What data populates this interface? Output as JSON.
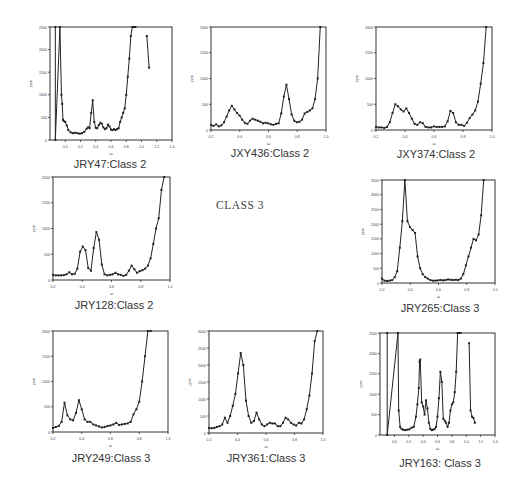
{
  "page": {
    "center_label": "CLASS 3"
  },
  "chart_data": [
    {
      "id": "JRY47",
      "type": "line",
      "title": "JRY47:Class 2",
      "xlabel": "ω",
      "ylabel": "ppm",
      "xticks": [
        "0.0",
        "0.2",
        "0.4",
        "0.6",
        "0.8",
        "1.0",
        "1.2",
        "1.4"
      ],
      "xlim": [
        -0.2,
        1.4
      ],
      "yticks": [
        "0",
        "500",
        "1000",
        "1500",
        "2000",
        "2500"
      ],
      "ylim": [
        0,
        2500
      ],
      "grid": false,
      "frame": {
        "x": 50,
        "y": 27,
        "w": 122,
        "h": 113
      },
      "caption_pos": {
        "x": 110,
        "y": 158
      },
      "x": [
        -0.13,
        -0.13,
        -0.07,
        -0.05,
        -0.04,
        -0.03,
        -0.02,
        0.0,
        0.02,
        0.04,
        0.07,
        0.1,
        0.13,
        0.16,
        0.19,
        0.22,
        0.25,
        0.28,
        0.3,
        0.32,
        0.34,
        0.36,
        0.38,
        0.4,
        0.42,
        0.44,
        0.46,
        0.48,
        0.5,
        0.52,
        0.54,
        0.56,
        0.58,
        0.6,
        0.62,
        0.64,
        0.66,
        0.68,
        0.7,
        0.72,
        0.74,
        0.76,
        0.78,
        0.8,
        0.82,
        0.84,
        0.86,
        0.88,
        0.9,
        0.92
      ],
      "values": [
        2500,
        0,
        2500,
        1000,
        800,
        450,
        420,
        400,
        320,
        220,
        170,
        150,
        160,
        150,
        140,
        150,
        180,
        250,
        280,
        260,
        600,
        880,
        400,
        270,
        260,
        330,
        380,
        360,
        280,
        240,
        260,
        340,
        300,
        230,
        220,
        240,
        220,
        240,
        260,
        400,
        500,
        600,
        700,
        1000,
        1400,
        1800,
        2300,
        2500,
        2500,
        2500
      ],
      "extra_segment": {
        "x": [
          1.07,
          1.1
        ],
        "values": [
          2300,
          1600
        ]
      }
    },
    {
      "id": "JXY436",
      "type": "line",
      "title": "JXY436:Class 2",
      "xlabel": "ω",
      "ylabel": "ppm",
      "xticks": [
        "0.2",
        "0.4",
        "0.6",
        "0.8",
        "1.0"
      ],
      "xlim": [
        0.2,
        1.0
      ],
      "yticks": [
        "0",
        "500",
        "1000",
        "1500",
        "2000"
      ],
      "ylim": [
        0,
        2000
      ],
      "grid": false,
      "frame": {
        "x": 211,
        "y": 27,
        "w": 115,
        "h": 103
      },
      "caption_pos": {
        "x": 270,
        "y": 147
      },
      "x": [
        0.2,
        0.22,
        0.24,
        0.26,
        0.28,
        0.3,
        0.32,
        0.34,
        0.36,
        0.38,
        0.4,
        0.42,
        0.44,
        0.46,
        0.48,
        0.5,
        0.52,
        0.54,
        0.56,
        0.58,
        0.6,
        0.62,
        0.64,
        0.66,
        0.68,
        0.7,
        0.72,
        0.74,
        0.76,
        0.78,
        0.8,
        0.82,
        0.84,
        0.86,
        0.88,
        0.9,
        0.92,
        0.94,
        0.96
      ],
      "values": [
        100,
        80,
        110,
        70,
        90,
        150,
        260,
        380,
        470,
        400,
        330,
        280,
        200,
        140,
        120,
        180,
        220,
        200,
        180,
        160,
        130,
        140,
        130,
        110,
        100,
        120,
        130,
        320,
        650,
        880,
        600,
        300,
        180,
        150,
        160,
        200,
        320,
        350,
        380,
        420,
        600,
        1000,
        2000
      ],
      "xs_note": "approximate digitization"
    },
    {
      "id": "JXY374",
      "type": "line",
      "title": "JXY374:Class 2",
      "xlabel": "ω",
      "ylabel": "ppm",
      "xticks": [
        "0.2",
        "0.4",
        "0.6",
        "0.8",
        "1.0"
      ],
      "xlim": [
        0.2,
        1.0
      ],
      "yticks": [
        "0",
        "500",
        "1000",
        "1500",
        "2000"
      ],
      "ylim": [
        0,
        2000
      ],
      "grid": false,
      "frame": {
        "x": 376,
        "y": 27,
        "w": 116,
        "h": 103
      },
      "caption_pos": {
        "x": 436,
        "y": 148
      },
      "x": [
        0.2,
        0.22,
        0.24,
        0.26,
        0.28,
        0.3,
        0.32,
        0.34,
        0.36,
        0.38,
        0.4,
        0.42,
        0.44,
        0.46,
        0.48,
        0.5,
        0.52,
        0.54,
        0.56,
        0.58,
        0.6,
        0.62,
        0.64,
        0.66,
        0.68,
        0.7,
        0.72,
        0.74,
        0.76,
        0.78,
        0.8,
        0.82,
        0.84,
        0.86,
        0.88,
        0.9,
        0.92,
        0.94,
        0.96
      ],
      "values": [
        60,
        50,
        50,
        40,
        60,
        150,
        330,
        500,
        460,
        400,
        360,
        420,
        330,
        220,
        120,
        100,
        150,
        130,
        60,
        50,
        50,
        70,
        60,
        60,
        60,
        70,
        170,
        370,
        330,
        150,
        100,
        100,
        80,
        140,
        230,
        300,
        380,
        550,
        900,
        1300,
        2000
      ]
    },
    {
      "id": "JRY128",
      "type": "line",
      "title": "JRY128:Class 2",
      "xlabel": "ω",
      "ylabel": "ppm",
      "xticks": [
        "0.2",
        "0.4",
        "0.6",
        "0.8",
        "1.0"
      ],
      "xlim": [
        0.2,
        1.0
      ],
      "yticks": [
        "0",
        "500",
        "1000",
        "1500",
        "2000"
      ],
      "ylim": [
        0,
        2000
      ],
      "grid": false,
      "frame": {
        "x": 53,
        "y": 177,
        "w": 117,
        "h": 103
      },
      "caption_pos": {
        "x": 114,
        "y": 299
      },
      "x": [
        0.2,
        0.22,
        0.24,
        0.26,
        0.28,
        0.3,
        0.32,
        0.34,
        0.36,
        0.38,
        0.4,
        0.42,
        0.44,
        0.46,
        0.48,
        0.5,
        0.52,
        0.54,
        0.56,
        0.58,
        0.6,
        0.62,
        0.64,
        0.66,
        0.68,
        0.7,
        0.72,
        0.74,
        0.76,
        0.78,
        0.8,
        0.82,
        0.84,
        0.86,
        0.88,
        0.9,
        0.92,
        0.94,
        0.96
      ],
      "values": [
        100,
        90,
        90,
        90,
        95,
        110,
        150,
        110,
        120,
        220,
        550,
        650,
        580,
        230,
        180,
        620,
        930,
        780,
        300,
        110,
        90,
        100,
        110,
        140,
        110,
        100,
        80,
        100,
        180,
        280,
        210,
        140,
        170,
        190,
        220,
        280,
        420,
        700,
        1000,
        1200,
        1750,
        2000
      ]
    },
    {
      "id": "JRY265",
      "type": "line",
      "title": "JRY265:Class 3",
      "xlabel": "ω",
      "ylabel": "ppm",
      "xticks": [
        "0.2",
        "0.4",
        "0.6",
        "0.8",
        "1.0"
      ],
      "xlim": [
        0.2,
        1.0
      ],
      "yticks": [
        "0",
        "500",
        "1000",
        "1500",
        "2000",
        "2500",
        "3000",
        "3500"
      ],
      "ylim": [
        0,
        3500
      ],
      "grid": false,
      "frame": {
        "x": 382,
        "y": 180,
        "w": 113,
        "h": 103
      },
      "caption_pos": {
        "x": 440,
        "y": 302
      },
      "x": [
        0.2,
        0.22,
        0.24,
        0.26,
        0.28,
        0.3,
        0.32,
        0.34,
        0.36,
        0.37,
        0.38,
        0.39,
        0.4,
        0.42,
        0.44,
        0.46,
        0.48,
        0.5,
        0.52,
        0.54,
        0.56,
        0.58,
        0.6,
        0.62,
        0.64,
        0.66,
        0.68,
        0.7,
        0.72,
        0.74,
        0.76,
        0.78,
        0.8,
        0.82,
        0.84,
        0.86,
        0.88,
        0.9,
        0.92
      ],
      "values": [
        150,
        80,
        70,
        80,
        100,
        200,
        400,
        1200,
        2100,
        3500,
        2100,
        1900,
        1800,
        1700,
        900,
        500,
        300,
        200,
        150,
        100,
        80,
        80,
        90,
        100,
        90,
        100,
        120,
        110,
        100,
        110,
        100,
        150,
        300,
        600,
        900,
        1200,
        1500,
        1450,
        1650,
        2300,
        3500
      ]
    },
    {
      "id": "JRY249",
      "type": "line",
      "title": "JRY249:Class 3",
      "xlabel": "ω",
      "ylabel": "ppm",
      "xticks": [
        "0.2",
        "0.4",
        "0.6",
        "0.8",
        "1.0"
      ],
      "xlim": [
        0.2,
        1.0
      ],
      "yticks": [
        "0",
        "500",
        "1000",
        "1500",
        "2000"
      ],
      "ylim": [
        0,
        2000
      ],
      "grid": false,
      "frame": {
        "x": 53,
        "y": 331,
        "w": 115,
        "h": 101
      },
      "caption_pos": {
        "x": 111,
        "y": 452
      },
      "x": [
        0.2,
        0.22,
        0.24,
        0.26,
        0.28,
        0.3,
        0.32,
        0.34,
        0.36,
        0.38,
        0.4,
        0.42,
        0.44,
        0.46,
        0.48,
        0.5,
        0.52,
        0.54,
        0.56,
        0.58,
        0.6,
        0.62,
        0.64,
        0.66,
        0.68,
        0.7,
        0.72,
        0.74,
        0.76,
        0.78,
        0.8,
        0.82,
        0.84,
        0.86,
        0.88
      ],
      "values": [
        80,
        100,
        120,
        200,
        580,
        330,
        250,
        230,
        380,
        630,
        450,
        250,
        200,
        200,
        150,
        130,
        110,
        90,
        100,
        120,
        130,
        150,
        180,
        140,
        150,
        160,
        170,
        200,
        350,
        450,
        600,
        1000,
        1500,
        2000,
        2000
      ]
    },
    {
      "id": "JRY361",
      "type": "line",
      "title": "JRY361:Class 3",
      "xlabel": "ω",
      "ylabel": "ppm",
      "xticks": [
        "0.2",
        "0.4",
        "0.6",
        "0.8",
        "1.0"
      ],
      "xlim": [
        0.2,
        1.0
      ],
      "yticks": [
        "0",
        "500",
        "1000",
        "1500",
        "2000",
        "2500",
        "3000"
      ],
      "ylim": [
        0,
        3000
      ],
      "grid": false,
      "frame": {
        "x": 209,
        "y": 331,
        "w": 114,
        "h": 102
      },
      "caption_pos": {
        "x": 266,
        "y": 452
      },
      "x": [
        0.2,
        0.22,
        0.24,
        0.26,
        0.28,
        0.3,
        0.32,
        0.34,
        0.36,
        0.38,
        0.4,
        0.42,
        0.44,
        0.46,
        0.48,
        0.5,
        0.52,
        0.54,
        0.56,
        0.58,
        0.6,
        0.62,
        0.64,
        0.66,
        0.68,
        0.7,
        0.72,
        0.74,
        0.76,
        0.78,
        0.8,
        0.82,
        0.84,
        0.86,
        0.88,
        0.9,
        0.92,
        0.94,
        0.96
      ],
      "values": [
        150,
        140,
        150,
        180,
        200,
        250,
        450,
        300,
        500,
        800,
        1150,
        1750,
        2350,
        2000,
        950,
        500,
        300,
        350,
        600,
        400,
        250,
        200,
        250,
        300,
        280,
        280,
        200,
        200,
        300,
        450,
        400,
        300,
        250,
        220,
        300,
        280,
        400,
        700,
        1100,
        1750,
        2700,
        3000
      ]
    },
    {
      "id": "JRY163",
      "type": "line",
      "title": "JRY163: Class 3",
      "xlabel": "ω",
      "ylabel": "ppm",
      "xticks": [
        "0.0",
        "0.2",
        "0.4",
        "0.6",
        "0.8",
        "1.0",
        "1.2",
        "1.4"
      ],
      "xlim": [
        -0.2,
        1.4
      ],
      "yticks": [
        "0",
        "500",
        "1000",
        "1500",
        "2000",
        "2500"
      ],
      "ylim": [
        0,
        2500
      ],
      "grid": false,
      "frame": {
        "x": 380,
        "y": 333,
        "w": 115,
        "h": 102
      },
      "caption_pos": {
        "x": 440,
        "y": 457
      },
      "x": [
        -0.1,
        -0.1,
        0.05,
        0.06,
        0.08,
        0.1,
        0.12,
        0.15,
        0.18,
        0.21,
        0.24,
        0.27,
        0.3,
        0.32,
        0.34,
        0.35,
        0.36,
        0.38,
        0.4,
        0.42,
        0.44,
        0.46,
        0.48,
        0.5,
        0.52,
        0.54,
        0.56,
        0.58,
        0.6,
        0.62,
        0.64,
        0.66,
        0.68,
        0.7,
        0.72,
        0.74,
        0.76,
        0.78,
        0.8,
        0.82,
        0.84,
        0.86,
        0.88,
        0.9,
        0.92
      ],
      "values": [
        2500,
        0,
        2500,
        600,
        200,
        150,
        130,
        120,
        130,
        140,
        180,
        200,
        450,
        750,
        1150,
        1800,
        1850,
        800,
        700,
        500,
        850,
        650,
        300,
        150,
        120,
        130,
        150,
        200,
        450,
        900,
        1550,
        1300,
        400,
        350,
        300,
        200,
        300,
        600,
        750,
        800,
        1050,
        1550,
        2500,
        2500,
        2500
      ],
      "extra_segment": {
        "x": [
          1.04,
          1.06,
          1.08,
          1.1,
          1.12
        ],
        "values": [
          2250,
          600,
          450,
          420,
          300
        ]
      }
    }
  ]
}
